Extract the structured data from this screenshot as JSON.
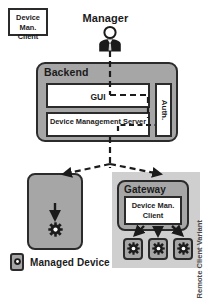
{
  "diagram": {
    "actor": {
      "label": "Manager",
      "icon": "person-icon"
    },
    "backend": {
      "label": "Backend",
      "components": [
        {
          "id": "gui",
          "label": "GUI",
          "icon": "gui-box"
        },
        {
          "id": "device-management-server",
          "label": "Device Management Server",
          "icon": "server-box"
        },
        {
          "id": "auth",
          "label": "Auth.",
          "icon": "auth-box",
          "orientation": "vertical"
        }
      ]
    },
    "managed_device_node": {
      "client_label": "Device Man. Client",
      "device_icon": "gear-icon"
    },
    "variant": {
      "label": "Remote Client Variant",
      "gateway_label": "Gateway",
      "client_label": "Device Man. Client",
      "device_count": 3,
      "device_icon": "gear-icon"
    },
    "legend": {
      "label": "Managed Device",
      "icon": "managed-device-icon"
    },
    "connections": [
      {
        "from": "Manager",
        "to": "GUI",
        "style": "dashed"
      },
      {
        "from": "GUI",
        "to": "Auth.",
        "style": "dashed"
      },
      {
        "from": "Device Management Server",
        "to": "Auth.",
        "style": "dashed"
      },
      {
        "from": "Backend",
        "to": "Device Man. Client",
        "style": "dashed-arrow"
      },
      {
        "from": "Backend",
        "to": "Gateway",
        "style": "dashed-arrow"
      },
      {
        "from": "Device Man. Client",
        "to": "Managed Device",
        "style": "solid-arrow"
      },
      {
        "from": "Gateway Client",
        "to": "Managed Devices",
        "style": "solid-arrow"
      }
    ],
    "colors": {
      "container_fill": "#a6a6a6",
      "variant_fill": "#cfcfcf",
      "component_fill": "#ffffff",
      "stroke": "#2b2b2b",
      "text": "#1b1b1b",
      "variant_text": "#4a4a4a"
    }
  }
}
